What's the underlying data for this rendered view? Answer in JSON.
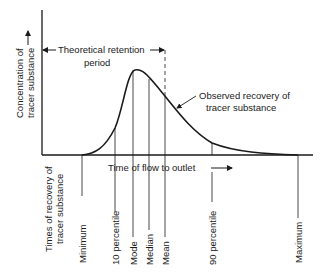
{
  "diagram": {
    "y_axis_label_line1": "Concentration of",
    "y_axis_label_line2": "tracer substance",
    "x_axis_label": "Time of flow to outlet",
    "retention_label_line1": "Theoretical retention",
    "retention_label_line2": "period",
    "curve_label_line1": "Observed recovery of",
    "curve_label_line2": "tracer substance",
    "times_label_line1": "Times of recovery of",
    "times_label_line2": "tracer substance",
    "markers": [
      {
        "id": "minimum",
        "label": "Minimum"
      },
      {
        "id": "p10",
        "label": "10 percentile"
      },
      {
        "id": "mode",
        "label": "Mode"
      },
      {
        "id": "median",
        "label": "Median"
      },
      {
        "id": "mean",
        "label": "Mean"
      },
      {
        "id": "p90",
        "label": "90 percentile"
      },
      {
        "id": "maximum",
        "label": "Maximum"
      }
    ]
  }
}
